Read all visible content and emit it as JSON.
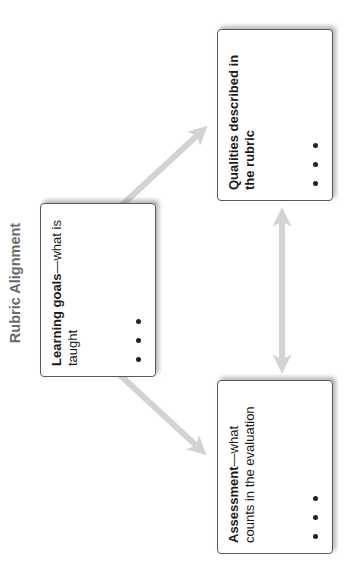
{
  "title": "Rubric Alignment",
  "boxes": {
    "learning_goals": {
      "bold": "Learning goals",
      "dash": "—",
      "rest": "what is taught",
      "ellipsis": "• • •"
    },
    "qualities": {
      "bold": "Qualities described in the rubric",
      "dash": "",
      "rest": "",
      "ellipsis": "• • •"
    },
    "assessment": {
      "bold": "Assessment",
      "dash": "—",
      "rest": "what counts in the evaluation",
      "ellipsis": "• • •"
    }
  },
  "arrows": [
    {
      "from": "learning_goals",
      "to": "qualities",
      "type": "single"
    },
    {
      "from": "learning_goals",
      "to": "assessment",
      "type": "single"
    },
    {
      "from": "qualities",
      "to": "assessment",
      "type": "double"
    }
  ],
  "colors": {
    "arrow": "#d3d3d3",
    "title": "#6a6a6a",
    "box_border": "#5a5a5a"
  },
  "orientation": "rotated -90deg (text reads bottom-to-top)"
}
